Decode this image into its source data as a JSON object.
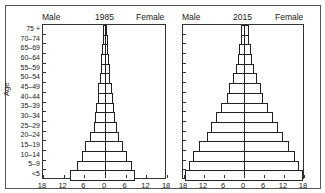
{
  "chart_data": [
    {
      "type": "bar",
      "subtype": "population-pyramid",
      "title": "1985",
      "left_label": "Male",
      "right_label": "Female",
      "ylabel": "Age",
      "xlabel": "",
      "categories": [
        "75 +",
        "70–74",
        "65–69",
        "60–64",
        "55–59",
        "50–54",
        "45–49",
        "40–44",
        "35–39",
        "30–34",
        "25–29",
        "20–24",
        "15–19",
        "10–14",
        "5–9",
        "<5"
      ],
      "series": [
        {
          "name": "Male",
          "values": [
            0.6,
            0.7,
            0.9,
            1.1,
            1.3,
            1.5,
            1.9,
            2.1,
            2.5,
            2.9,
            3.2,
            4.4,
            5.9,
            6.6,
            8.1,
            10.2
          ]
        },
        {
          "name": "Female",
          "values": [
            0.6,
            0.8,
            1.0,
            1.1,
            1.4,
            1.5,
            1.9,
            2.2,
            2.6,
            2.9,
            3.4,
            4.2,
            5.3,
            6.5,
            7.7,
            8.8
          ]
        }
      ],
      "xticks": [
        "18",
        "12",
        "6",
        "0",
        "6",
        "12",
        "18"
      ],
      "xlim": [
        -18,
        18
      ],
      "grid": false
    },
    {
      "type": "bar",
      "subtype": "population-pyramid",
      "title": "2015",
      "left_label": "Male",
      "right_label": "Female",
      "ylabel": "Age",
      "xlabel": "",
      "categories": [
        "75 +",
        "70–74",
        "65–69",
        "60–64",
        "55–59",
        "50–54",
        "45–49",
        "40–44",
        "35–39",
        "30–34",
        "25–29",
        "20–24",
        "15–19",
        "10–14",
        "5–9",
        "<5"
      ],
      "series": [
        {
          "name": "Male",
          "values": [
            0.8,
            0.8,
            1.4,
            1.8,
            2.4,
            3.2,
            4.4,
            5.2,
            6.8,
            8.4,
            9.8,
            11.2,
            13.4,
            15.2,
            16.6,
            17.6
          ]
        },
        {
          "name": "Female",
          "values": [
            1.4,
            1.6,
            2.0,
            2.4,
            3.0,
            3.8,
            5.0,
            5.8,
            7.2,
            8.8,
            10.2,
            11.6,
            13.6,
            15.4,
            16.4,
            17.6
          ]
        }
      ],
      "xticks": [
        "18",
        "12",
        "6",
        "0",
        "6",
        "12",
        "18"
      ],
      "xlim": [
        -18,
        18
      ],
      "grid": false
    }
  ],
  "panels": [
    {
      "title": "1985",
      "left_label": "Male",
      "right_label": "Female"
    },
    {
      "title": "2015",
      "left_label": "Male",
      "right_label": "Female"
    }
  ],
  "axis": {
    "age_title": "Age",
    "age_groups": [
      "75 +",
      "70–74",
      "65–69",
      "60–64",
      "55–59",
      "50–54",
      "45–49",
      "40–44",
      "35–39",
      "30–34",
      "25–29",
      "20–24",
      "15–19",
      "10–14",
      "5–9",
      "<5"
    ],
    "xticks": [
      "18",
      "12",
      "6",
      "0",
      "6",
      "12",
      "18"
    ]
  }
}
